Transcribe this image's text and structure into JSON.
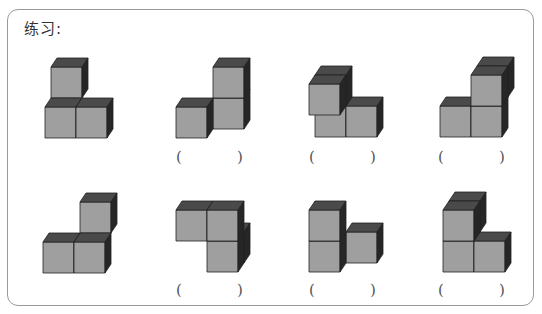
{
  "title": "练习:",
  "colors": {
    "front": "#9f9f9f",
    "top": "#4a4a4a",
    "side": "#262626",
    "edge": "#222222",
    "frame": "#9a9a9a"
  },
  "cube": {
    "size": 31,
    "dx": 6,
    "dy": -9
  },
  "figures": [
    {
      "id": 1,
      "origin": [
        45,
        138
      ],
      "cubes": [
        [
          0,
          0,
          0
        ],
        [
          1,
          0,
          0
        ],
        [
          0,
          1,
          1
        ]
      ],
      "has_answer": false
    },
    {
      "id": 2,
      "origin": [
        176,
        138
      ],
      "cubes": [
        [
          0,
          0,
          0
        ],
        [
          1,
          0,
          1
        ],
        [
          1,
          1,
          1
        ]
      ],
      "has_answer": true
    },
    {
      "id": 3,
      "origin": [
        315,
        137
      ],
      "cubes": [
        [
          0,
          0,
          0
        ],
        [
          1,
          0,
          0
        ],
        [
          0,
          1,
          0
        ],
        [
          0,
          1,
          -1
        ]
      ],
      "has_answer": true
    },
    {
      "id": 4,
      "origin": [
        440,
        137
      ],
      "cubes": [
        [
          0,
          0,
          0
        ],
        [
          1,
          0,
          0
        ],
        [
          1,
          1,
          0
        ],
        [
          1,
          1,
          1
        ]
      ],
      "has_answer": true
    },
    {
      "id": 5,
      "origin": [
        43,
        273
      ],
      "cubes": [
        [
          0,
          0,
          0
        ],
        [
          1,
          0,
          0
        ],
        [
          1,
          1,
          1
        ]
      ],
      "has_answer": false
    },
    {
      "id": 6,
      "origin": [
        176,
        272
      ],
      "cubes": [
        [
          1,
          0,
          0
        ],
        [
          0,
          1,
          0
        ],
        [
          1,
          1,
          0
        ],
        [
          1,
          0,
          1
        ]
      ],
      "has_answer": true
    },
    {
      "id": 7,
      "origin": [
        309,
        272
      ],
      "cubes": [
        [
          0,
          0,
          0
        ],
        [
          0,
          1,
          0
        ],
        [
          1,
          0,
          1
        ]
      ],
      "has_answer": true
    },
    {
      "id": 8,
      "origin": [
        443,
        272
      ],
      "cubes": [
        [
          0,
          0,
          0
        ],
        [
          1,
          0,
          0
        ],
        [
          0,
          1,
          0
        ],
        [
          0,
          1,
          1
        ]
      ],
      "has_answer": true
    }
  ],
  "answers": [
    {
      "left": "(",
      "right": ")",
      "x1": 176,
      "x2": 237,
      "y": 148,
      "value": ""
    },
    {
      "left": "(",
      "right": ")",
      "x1": 309,
      "x2": 370,
      "y": 148,
      "value": ""
    },
    {
      "left": "(",
      "right": ")",
      "x1": 438,
      "x2": 499,
      "y": 148,
      "value": ""
    },
    {
      "left": "(",
      "right": ")",
      "x1": 176,
      "x2": 237,
      "y": 281,
      "value": ""
    },
    {
      "left": "(",
      "right": ")",
      "x1": 309,
      "x2": 370,
      "y": 281,
      "value": ""
    },
    {
      "left": "(",
      "right": ")",
      "x1": 438,
      "x2": 499,
      "y": 281,
      "value": ""
    }
  ]
}
